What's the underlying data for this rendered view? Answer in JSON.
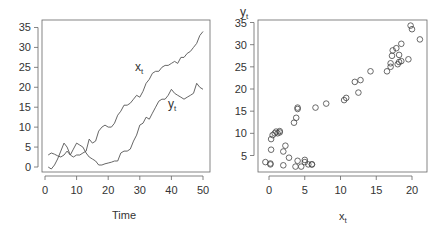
{
  "chart_data": [
    {
      "type": "line",
      "title": "",
      "xlabel": "Time",
      "ylabel": "",
      "xlim": [
        0,
        50
      ],
      "ylim": [
        -1,
        36
      ],
      "xticks": [
        0,
        10,
        20,
        30,
        40,
        50
      ],
      "yticks": [
        0,
        5,
        10,
        15,
        20,
        25,
        30,
        35
      ],
      "grid": false,
      "legend": "none",
      "annotations": [
        {
          "text": "x",
          "sub": "t",
          "x": 31,
          "y": 25
        },
        {
          "text": "y",
          "sub": "t",
          "x": 40,
          "y": 15
        }
      ],
      "x": [
        1,
        2,
        3,
        4,
        5,
        6,
        7,
        8,
        9,
        10,
        11,
        12,
        13,
        14,
        15,
        16,
        17,
        18,
        19,
        20,
        21,
        22,
        23,
        24,
        25,
        26,
        27,
        28,
        29,
        30,
        31,
        32,
        33,
        34,
        35,
        36,
        37,
        38,
        39,
        40,
        41,
        42,
        43,
        44,
        45,
        46,
        47,
        48,
        49,
        50
      ],
      "series": [
        {
          "name": "x_t",
          "values": [
            3,
            3.5,
            3.2,
            2.8,
            2.5,
            3,
            4,
            3,
            2.5,
            3,
            3,
            3.5,
            4,
            7,
            6,
            6.5,
            9,
            10,
            10.5,
            10,
            10,
            11,
            13,
            14,
            15.5,
            15.5,
            16,
            17,
            18,
            17.5,
            19,
            21,
            22,
            23.5,
            24,
            24,
            25,
            25.5,
            25.5,
            26,
            26.5,
            26,
            27.5,
            27.5,
            28.5,
            29,
            30,
            31,
            33,
            34
          ]
        },
        {
          "name": "y_t",
          "values": [
            0,
            -0.5,
            0.5,
            2,
            4,
            6,
            5,
            3,
            4.5,
            6,
            5.5,
            5,
            3.5,
            2.5,
            2,
            1.5,
            0.5,
            0.5,
            0.8,
            1,
            1.2,
            1.5,
            1.5,
            3.5,
            4,
            4,
            4.5,
            6.5,
            8,
            10.5,
            11,
            12.5,
            12,
            13.5,
            15,
            16.5,
            17,
            17,
            18,
            19.5,
            18.5,
            18,
            17.5,
            17,
            17.5,
            18,
            18.5,
            21,
            20,
            19.5
          ]
        }
      ]
    },
    {
      "type": "scatter",
      "title": "",
      "xlabel": "x",
      "xlabel_sub": "t",
      "ylabel": "y",
      "ylabel_sub": "t",
      "xlim": [
        -0.8,
        22
      ],
      "ylim": [
        2,
        36
      ],
      "xticks": [
        0,
        5,
        10,
        15,
        20
      ],
      "yticks": [
        5,
        10,
        15,
        20,
        25,
        30,
        35
      ],
      "grid": false,
      "marker": "open-circle",
      "points": [
        [
          0.2,
          3
        ],
        [
          -0.5,
          3.5
        ],
        [
          0.2,
          3.2
        ],
        [
          2,
          2.8
        ],
        [
          3.7,
          2.5
        ],
        [
          6,
          3
        ],
        [
          5,
          4
        ],
        [
          2.8,
          4.5
        ],
        [
          4.5,
          2.5
        ],
        [
          6,
          3
        ],
        [
          5.5,
          3
        ],
        [
          5,
          3.5
        ],
        [
          4,
          3.8
        ],
        [
          2.3,
          7.2
        ],
        [
          2,
          5.9
        ],
        [
          0.3,
          6.3
        ],
        [
          0.3,
          8.7
        ],
        [
          0.5,
          9.6
        ],
        [
          0.8,
          10
        ],
        [
          1,
          10.4
        ],
        [
          1.2,
          10
        ],
        [
          1.5,
          10.5
        ],
        [
          1.5,
          10.2
        ],
        [
          3.5,
          12.4
        ],
        [
          4,
          15.5
        ],
        [
          4,
          15.8
        ],
        [
          3.8,
          13.5
        ],
        [
          6.5,
          15.8
        ],
        [
          8,
          16.7
        ],
        [
          10.5,
          17.5
        ],
        [
          10.8,
          18
        ],
        [
          12.5,
          19.2
        ],
        [
          12,
          21.6
        ],
        [
          12.8,
          22
        ],
        [
          14.2,
          24
        ],
        [
          16.5,
          24
        ],
        [
          17,
          25
        ],
        [
          17,
          25.8
        ],
        [
          17.2,
          27.5
        ],
        [
          17.3,
          28.7
        ],
        [
          17.8,
          29.2
        ],
        [
          18.5,
          30.2
        ],
        [
          18.2,
          27.7
        ],
        [
          18.2,
          26.1
        ],
        [
          18,
          25.6
        ],
        [
          18.5,
          26.3
        ],
        [
          19.5,
          26.7
        ],
        [
          19.8,
          34.3
        ],
        [
          20,
          33.5
        ],
        [
          21.1,
          31.2
        ]
      ]
    }
  ]
}
